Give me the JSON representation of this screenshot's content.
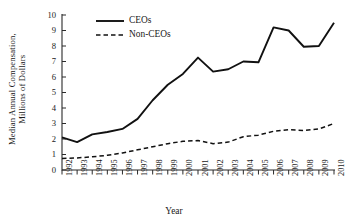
{
  "chart_data": {
    "type": "line",
    "title": "",
    "xlabel": "Year",
    "ylabel": "Median Annual Compensation, Millions of Dollars",
    "ylabel_line1": "Median Annual Compensation,",
    "ylabel_line2": "Millions of Dollars",
    "x": [
      1992,
      1993,
      1994,
      1995,
      1996,
      1997,
      1998,
      1999,
      2000,
      2001,
      2002,
      2003,
      2004,
      2005,
      2006,
      2007,
      2008,
      2009,
      2010
    ],
    "categories": [
      "1992",
      "1993",
      "1994",
      "1995",
      "1996",
      "1997",
      "1998",
      "1999",
      "2000",
      "2001",
      "2002",
      "2003",
      "2004",
      "2005",
      "2006",
      "2007",
      "2008",
      "2009",
      "2010"
    ],
    "yticks": [
      "0",
      "1",
      "2",
      "3",
      "4",
      "5",
      "6",
      "7",
      "8",
      "9",
      "10"
    ],
    "ylim": [
      0,
      10
    ],
    "xlim": [
      1992,
      2010
    ],
    "grid": false,
    "legend_position": "top-left-inside",
    "series": [
      {
        "name": "CEOs",
        "style": "solid",
        "color": "#111111",
        "values": [
          2.1,
          1.8,
          2.3,
          2.45,
          2.65,
          3.3,
          4.5,
          5.5,
          6.2,
          7.25,
          6.35,
          6.5,
          7.0,
          6.95,
          9.2,
          9.0,
          7.95,
          8.0,
          9.5
        ]
      },
      {
        "name": "Non-CEOs",
        "style": "dashed",
        "color": "#111111",
        "values": [
          0.75,
          0.78,
          0.85,
          0.95,
          1.1,
          1.3,
          1.5,
          1.7,
          1.85,
          1.9,
          1.7,
          1.8,
          2.15,
          2.25,
          2.5,
          2.6,
          2.55,
          2.65,
          3.0
        ]
      }
    ]
  }
}
